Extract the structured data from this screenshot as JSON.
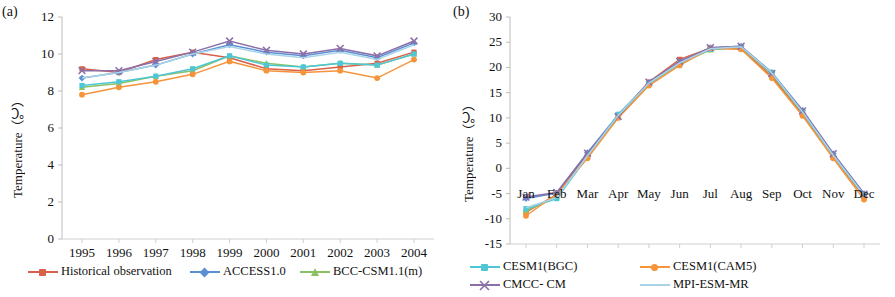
{
  "figure": {
    "panel_a_tag": "(a)",
    "panel_b_tag": "(b)",
    "y_axis_title": "Temperature（℃）"
  },
  "legend": {
    "items": [
      {
        "label": "Historical observation",
        "color": "#D9614A",
        "marker": "square"
      },
      {
        "label": "ACCESS1.0",
        "color": "#5B8FD4",
        "marker": "diamond"
      },
      {
        "label": "BCC-CSM1.1(m)",
        "color": "#8CC163",
        "marker": "triangle"
      },
      {
        "label": "CESM1(BGC)",
        "color": "#4FC6D4",
        "marker": "square"
      },
      {
        "label": "CESM1(CAM5)",
        "color": "#F5943B",
        "marker": "circle"
      },
      {
        "label": "CMCC- CM",
        "color": "#8B6FA8",
        "marker": "x"
      },
      {
        "label": "MPI-ESM-MR",
        "color": "#A8D4E8",
        "marker": "none"
      }
    ]
  },
  "chart_data": [
    {
      "type": "line",
      "panel": "(a)",
      "title": "",
      "xlabel": "",
      "ylabel": "Temperature（℃）",
      "ylim": [
        0,
        12
      ],
      "yticks": [
        0,
        2,
        4,
        6,
        8,
        10,
        12
      ],
      "grid": false,
      "legend_position": "below",
      "categories": [
        "1995",
        "1996",
        "1997",
        "1998",
        "1999",
        "2000",
        "2001",
        "2002",
        "2003",
        "2004"
      ],
      "series": [
        {
          "name": "Historical observation",
          "color": "#D9614A",
          "marker": "square",
          "values": [
            9.2,
            9.0,
            9.7,
            10.1,
            9.8,
            9.2,
            9.1,
            9.3,
            9.5,
            10.1
          ]
        },
        {
          "name": "ACCESS1.0",
          "color": "#5B8FD4",
          "marker": "diamond",
          "values": [
            8.7,
            9.0,
            9.4,
            10.0,
            10.5,
            10.1,
            9.9,
            10.2,
            9.8,
            10.6
          ]
        },
        {
          "name": "BCC-CSM1.1(m)",
          "color": "#8CC163",
          "marker": "triangle",
          "values": [
            8.2,
            8.4,
            8.8,
            9.1,
            9.9,
            9.5,
            9.3,
            9.5,
            9.4,
            10.0
          ]
        },
        {
          "name": "CESM1(BGC)",
          "color": "#4FC6D4",
          "marker": "square",
          "values": [
            8.3,
            8.5,
            8.8,
            9.2,
            9.9,
            9.4,
            9.3,
            9.5,
            9.4,
            10.0
          ]
        },
        {
          "name": "CESM1(CAM5)",
          "color": "#F5943B",
          "marker": "circle",
          "values": [
            7.8,
            8.2,
            8.5,
            8.9,
            9.6,
            9.1,
            9.0,
            9.1,
            8.7,
            9.7
          ]
        },
        {
          "name": "CMCC- CM",
          "color": "#8B6FA8",
          "marker": "x",
          "values": [
            9.1,
            9.1,
            9.6,
            10.1,
            10.7,
            10.2,
            10.0,
            10.3,
            9.9,
            10.7
          ]
        },
        {
          "name": "MPI-ESM-MR",
          "color": "#A8D4E8",
          "marker": "none",
          "values": [
            8.7,
            9.0,
            9.4,
            10.0,
            10.4,
            10.0,
            9.8,
            10.1,
            9.7,
            10.5
          ]
        }
      ]
    },
    {
      "type": "line",
      "panel": "(b)",
      "title": "",
      "xlabel": "",
      "ylabel": "Temperature（℃）",
      "ylim": [
        -15,
        30
      ],
      "yticks": [
        -15,
        -10,
        -5,
        0,
        5,
        10,
        15,
        20,
        25,
        30
      ],
      "grid": false,
      "legend_position": "below",
      "categories": [
        "Jan",
        "Feb",
        "Mar",
        "Apr",
        "May",
        "Jun",
        "Jul",
        "Aug",
        "Sep",
        "Oct",
        "Nov",
        "Dec"
      ],
      "series": [
        {
          "name": "Historical observation",
          "color": "#D9614A",
          "marker": "square",
          "values": [
            -8.7,
            -5.2,
            2.6,
            10.4,
            17.1,
            21.6,
            23.8,
            23.7,
            18.2,
            10.8,
            2.2,
            -5.6
          ]
        },
        {
          "name": "ACCESS1.0",
          "color": "#5B8FD4",
          "marker": "diamond",
          "values": [
            -6.0,
            -4.9,
            3.1,
            10.6,
            17.0,
            21.0,
            23.9,
            24.2,
            19.0,
            11.5,
            2.9,
            -5.0
          ]
        },
        {
          "name": "BCC-CSM1.1(m)",
          "color": "#8CC163",
          "marker": "triangle",
          "values": [
            -8.4,
            -5.6,
            2.4,
            10.1,
            16.7,
            20.7,
            23.5,
            24.0,
            18.6,
            11.0,
            2.4,
            -5.4
          ]
        },
        {
          "name": "CESM1(BGC)",
          "color": "#4FC6D4",
          "marker": "square",
          "values": [
            -8.0,
            -6.0,
            2.3,
            10.7,
            16.8,
            20.8,
            23.6,
            24.0,
            19.0,
            11.1,
            2.4,
            -5.2
          ]
        },
        {
          "name": "CESM1(CAM5)",
          "color": "#F5943B",
          "marker": "circle",
          "values": [
            -9.4,
            -5.1,
            2.0,
            10.0,
            16.4,
            20.4,
            23.8,
            23.6,
            17.9,
            10.4,
            2.0,
            -6.2
          ]
        },
        {
          "name": "CMCC- CM",
          "color": "#8B6FA8",
          "marker": "x",
          "values": [
            -5.7,
            -4.8,
            3.0,
            10.3,
            17.1,
            21.2,
            23.9,
            24.2,
            18.8,
            11.4,
            2.9,
            -5.1
          ]
        },
        {
          "name": "MPI-ESM-MR",
          "color": "#A8D4E8",
          "marker": "none",
          "values": [
            -7.8,
            -5.8,
            2.5,
            10.5,
            16.9,
            20.9,
            23.7,
            24.1,
            18.9,
            11.2,
            2.6,
            -5.3
          ]
        }
      ]
    }
  ]
}
